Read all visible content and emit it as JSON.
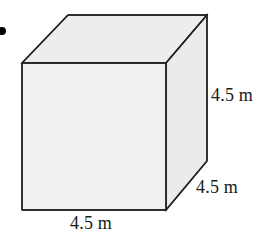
{
  "figure": {
    "name": "cube-diagram",
    "shape": "cube",
    "background_color": "#ffffff",
    "bullet": {
      "name": "bullet-marker",
      "shape": "filled-circle",
      "color": "#000000",
      "x": 2,
      "y": 31,
      "radius": 4
    },
    "faces": {
      "front": {
        "name": "front-face",
        "fill": "#f0f0f0",
        "stroke": "#222222",
        "points": "22,63 166,63 166,210 22,210"
      },
      "top": {
        "name": "top-face",
        "fill": "#ededed",
        "stroke": "#222222",
        "points": "22,63 68,15 207,15 166,63"
      },
      "right": {
        "name": "right-face",
        "fill": "#ebebeb",
        "stroke": "#222222",
        "points": "166,63 207,15 207,161 166,210"
      }
    },
    "stroke_width": 1.4,
    "labels": [
      {
        "name": "label-right-height",
        "text": "4.5 m",
        "edge": "vertical-right-height",
        "x": 211,
        "y": 86
      },
      {
        "name": "label-depth",
        "text": "4.5 m",
        "edge": "depth-diagonal",
        "x": 196,
        "y": 178
      },
      {
        "name": "label-width",
        "text": "4.5 m",
        "edge": "bottom-front-width",
        "x": 70,
        "y": 214
      }
    ],
    "dimension_value": "4.5 m",
    "unit": "m",
    "side_length": 4.5
  }
}
